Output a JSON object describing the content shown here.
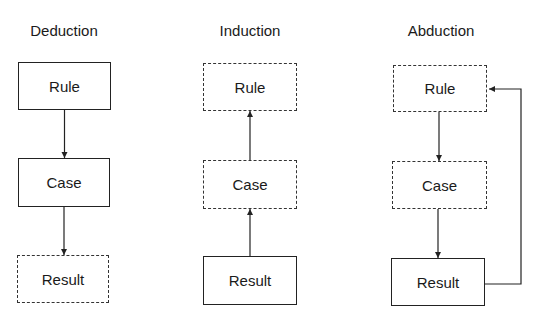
{
  "diagram": {
    "type": "flow",
    "columns": [
      {
        "title": "Deduction",
        "nodes": [
          {
            "label": "Rule",
            "style": "solid"
          },
          {
            "label": "Case",
            "style": "solid"
          },
          {
            "label": "Result",
            "style": "dashed"
          }
        ],
        "edges": [
          {
            "from": "Rule",
            "to": "Case"
          },
          {
            "from": "Case",
            "to": "Result"
          }
        ]
      },
      {
        "title": "Induction",
        "nodes": [
          {
            "label": "Rule",
            "style": "dashed"
          },
          {
            "label": "Case",
            "style": "dashed"
          },
          {
            "label": "Result",
            "style": "solid"
          }
        ],
        "edges": [
          {
            "from": "Result",
            "to": "Case"
          },
          {
            "from": "Case",
            "to": "Rule"
          }
        ]
      },
      {
        "title": "Abduction",
        "nodes": [
          {
            "label": "Rule",
            "style": "dashed"
          },
          {
            "label": "Case",
            "style": "dashed"
          },
          {
            "label": "Result",
            "style": "solid"
          }
        ],
        "edges": [
          {
            "from": "Rule",
            "to": "Case"
          },
          {
            "from": "Case",
            "to": "Result"
          },
          {
            "from": "Result",
            "to": "Rule",
            "routing": "loop-right"
          }
        ]
      }
    ]
  }
}
